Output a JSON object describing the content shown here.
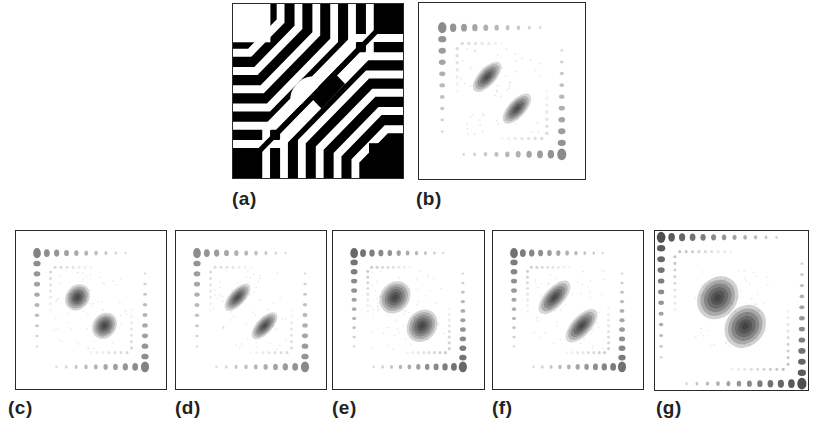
{
  "figure": {
    "panels": [
      {
        "id": "a",
        "label": "(a)",
        "type": "binary-moire",
        "box": [
          232,
          3,
          172,
          176
        ],
        "label_pos": [
          232,
          188
        ]
      },
      {
        "id": "b",
        "label": "(b)",
        "type": "spot-pattern",
        "box": [
          418,
          2,
          168,
          178
        ],
        "label_pos": [
          416,
          188
        ],
        "center": {
          "style": "elongated",
          "size": 0.55,
          "darkness": 0.85
        },
        "grid_density": "medium",
        "grid_strength": 0.55
      },
      {
        "id": "c",
        "label": "(c)",
        "type": "spot-pattern",
        "box": [
          15,
          230,
          152,
          160
        ],
        "label_pos": [
          8,
          397
        ],
        "center": {
          "style": "round",
          "size": 0.55,
          "darkness": 0.9
        },
        "grid_density": "medium",
        "grid_strength": 0.6
      },
      {
        "id": "d",
        "label": "(d)",
        "type": "spot-pattern",
        "box": [
          175,
          230,
          152,
          160
        ],
        "label_pos": [
          175,
          397
        ],
        "center": {
          "style": "elongated",
          "size": 0.55,
          "darkness": 0.85
        },
        "grid_density": "medium",
        "grid_strength": 0.55
      },
      {
        "id": "e",
        "label": "(e)",
        "type": "spot-pattern",
        "box": [
          332,
          230,
          153,
          160
        ],
        "label_pos": [
          332,
          397
        ],
        "center": {
          "style": "round",
          "size": 0.68,
          "darkness": 0.9
        },
        "grid_density": "dense",
        "grid_strength": 0.75
      },
      {
        "id": "f",
        "label": "(f)",
        "type": "spot-pattern",
        "box": [
          492,
          230,
          152,
          160
        ],
        "label_pos": [
          492,
          397
        ],
        "center": {
          "style": "elongated",
          "size": 0.68,
          "darkness": 0.88
        },
        "grid_density": "dense",
        "grid_strength": 0.7
      },
      {
        "id": "g",
        "label": "(g)",
        "type": "spot-pattern",
        "box": [
          654,
          230,
          155,
          161
        ],
        "label_pos": [
          656,
          397
        ],
        "center": {
          "style": "round",
          "size": 0.9,
          "darkness": 0.95
        },
        "grid_density": "full",
        "grid_strength": 0.9
      }
    ]
  }
}
